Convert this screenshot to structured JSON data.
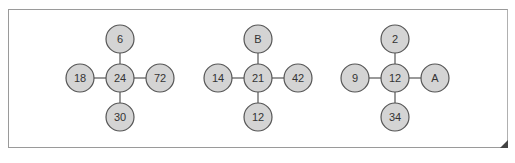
{
  "diagram": {
    "groups": [
      {
        "center": "24",
        "top": "6",
        "left": "18",
        "right": "72",
        "bottom": "30",
        "cx": 120
      },
      {
        "center": "21",
        "top": "B",
        "left": "14",
        "right": "42",
        "bottom": "12",
        "cx": 258
      },
      {
        "center": "12",
        "top": "2",
        "left": "9",
        "right": "A",
        "bottom": "34",
        "cx": 395
      }
    ],
    "node_fill": "#d4d4d4",
    "node_stroke": "#555555"
  }
}
